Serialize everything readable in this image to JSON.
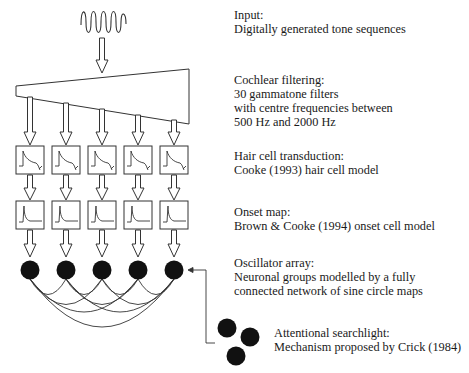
{
  "stages": [
    {
      "id": "input",
      "heading": "Input:",
      "lines": [
        "Digitally generated tone sequences"
      ]
    },
    {
      "id": "cochlear",
      "heading": "Cochlear filtering:",
      "lines": [
        "30 gammatone filters",
        "with centre frequencies between",
        "500 Hz and 2000 Hz"
      ]
    },
    {
      "id": "haircell",
      "heading": "Hair cell transduction:",
      "lines": [
        "Cooke (1993) hair cell model"
      ]
    },
    {
      "id": "onset",
      "heading": "Onset map:",
      "lines": [
        "Brown & Cooke (1994) onset cell model"
      ]
    },
    {
      "id": "oscillator",
      "heading": "Oscillator array:",
      "lines": [
        "Neuronal groups modelled by a fully",
        "connected network of sine circle maps"
      ]
    },
    {
      "id": "attention",
      "heading": "Attentional searchlight:",
      "lines": [
        "Mechanism proposed by Crick (1984)"
      ]
    }
  ],
  "diagram": {
    "channels": 5,
    "channel_x": [
      30,
      66,
      102,
      138,
      174
    ],
    "stroke_color": "#333333",
    "node_color": "#111111"
  }
}
